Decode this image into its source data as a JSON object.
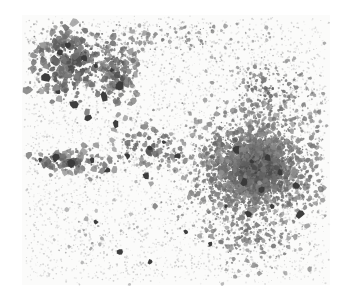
{
  "figure": {
    "title": "Speckle density scan",
    "kind": "grayscale-dot-density-scan",
    "width": 343,
    "height": 305,
    "background_color": "#ffffff",
    "paper_tone": "#fbfbfa",
    "dot_color_dark": "#2f2f2f",
    "dot_color_mid": "#6a6a6a",
    "dot_color_faint": "#b8b8b8",
    "alt_text": "Dense irregular field of dark speckles and blobs on white paper, with a heavy blob cluster in the upper left and a fine dense cluster at center right."
  },
  "plate": {
    "margin_left": 22,
    "margin_top": 15,
    "margin_right": 13,
    "margin_bottom": 20,
    "content_left": 22,
    "content_top": 15,
    "content_right": 330,
    "content_bottom": 285
  },
  "chart_data": {
    "type": "scatter",
    "title": "Speckle density scan",
    "xlabel": "",
    "ylabel": "",
    "xlim": [
      22,
      330
    ],
    "ylim": [
      15,
      285
    ],
    "grid": false,
    "legend": null,
    "point_color": "#2f2f2f",
    "clusters": [
      {
        "name": "upper-left-blob-cluster",
        "cx": 72,
        "cy": 62,
        "rx": 52,
        "ry": 44,
        "count": 620,
        "weight": 1.0,
        "size_min": 0.9,
        "size_max": 4.6,
        "darkness": 0.92
      },
      {
        "name": "upper-left-ridge",
        "cx": 118,
        "cy": 72,
        "rx": 22,
        "ry": 40,
        "count": 300,
        "weight": 0.95,
        "size_min": 0.8,
        "size_max": 3.8,
        "darkness": 0.9
      },
      {
        "name": "left-mid-streak",
        "cx": 70,
        "cy": 162,
        "rx": 55,
        "ry": 13,
        "count": 210,
        "weight": 0.85,
        "size_min": 0.9,
        "size_max": 4.2,
        "darkness": 0.88
      },
      {
        "name": "center-diagonal-band",
        "cx": 150,
        "cy": 150,
        "rx": 42,
        "ry": 26,
        "count": 260,
        "weight": 0.75,
        "size_min": 0.8,
        "size_max": 3.6,
        "darkness": 0.85
      },
      {
        "name": "right-core-cluster",
        "cx": 252,
        "cy": 168,
        "rx": 66,
        "ry": 58,
        "count": 2600,
        "weight": 1.0,
        "size_min": 0.7,
        "size_max": 3.0,
        "darkness": 0.9
      },
      {
        "name": "right-core-dense-knot",
        "cx": 258,
        "cy": 170,
        "rx": 38,
        "ry": 34,
        "count": 1500,
        "weight": 1.0,
        "size_min": 0.7,
        "size_max": 3.4,
        "darkness": 0.95
      },
      {
        "name": "right-upper-halo",
        "cx": 268,
        "cy": 95,
        "rx": 56,
        "ry": 44,
        "count": 620,
        "weight": 0.6,
        "size_min": 0.7,
        "size_max": 2.6,
        "darkness": 0.8
      },
      {
        "name": "right-lower-halo",
        "cx": 250,
        "cy": 238,
        "rx": 62,
        "ry": 36,
        "count": 520,
        "weight": 0.55,
        "size_min": 0.7,
        "size_max": 2.8,
        "darkness": 0.78
      },
      {
        "name": "top-band-scatter",
        "cx": 180,
        "cy": 40,
        "rx": 110,
        "ry": 28,
        "count": 420,
        "weight": 0.45,
        "size_min": 0.6,
        "size_max": 2.4,
        "darkness": 0.72
      },
      {
        "name": "lower-left-sparse",
        "cx": 95,
        "cy": 235,
        "rx": 70,
        "ry": 45,
        "count": 260,
        "weight": 0.3,
        "size_min": 0.6,
        "size_max": 2.8,
        "darkness": 0.6
      },
      {
        "name": "far-right-edge",
        "cx": 318,
        "cy": 150,
        "rx": 16,
        "ry": 90,
        "count": 200,
        "weight": 0.4,
        "size_min": 0.6,
        "size_max": 2.4,
        "darkness": 0.7
      }
    ],
    "background_noise": {
      "name": "paper-grain",
      "count": 5200,
      "size_min": 0.35,
      "size_max": 1.1,
      "darkness": 0.35
    },
    "totals": {
      "cluster_points": 7510,
      "noise_points": 5200,
      "points_total": 12710
    }
  }
}
